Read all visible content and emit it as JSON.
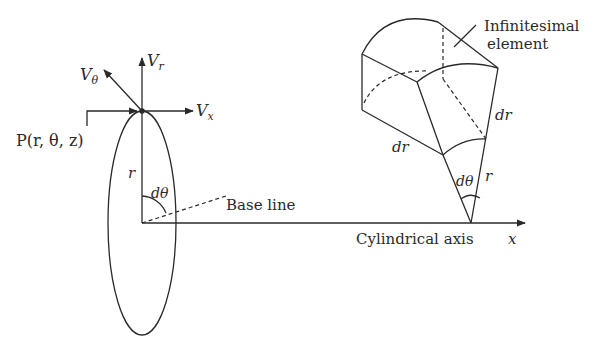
{
  "diagram": {
    "type": "cylindrical-coordinates-element",
    "colors": {
      "ink": "#2a2a2a",
      "background": "#ffffff"
    },
    "left_figure": {
      "point_label": "P(r, θ, z)",
      "vector_labels": {
        "v_r": "Vr",
        "v_theta": "Vθ",
        "v_x": "Vx"
      },
      "radius_label": "r",
      "angle_label": "dθ",
      "base_line_label": "Base line"
    },
    "axis": {
      "label": "Cylindrical axis",
      "variable": "x"
    },
    "right_figure": {
      "element_label_line1": "Infinitesimal",
      "element_label_line2": "element",
      "dr_label_left": "dr",
      "dr_label_right": "dr",
      "angle_label": "dθ",
      "radius_label": "r"
    }
  }
}
